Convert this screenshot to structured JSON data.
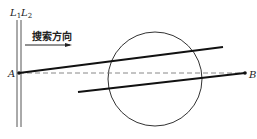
{
  "diagram": {
    "labels": {
      "line1": "L",
      "line1_sub": "1",
      "line2": "L",
      "line2_sub": "2",
      "direction": "搜索方向",
      "point_a": "A",
      "point_b": "B"
    },
    "colors": {
      "line": "#111111",
      "thin": "#555555",
      "dashed": "#888888"
    }
  }
}
